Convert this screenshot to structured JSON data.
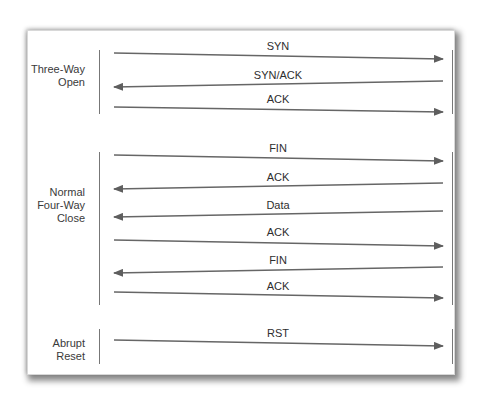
{
  "diagram": {
    "title": "",
    "colors": {
      "line": "#6b6b6b",
      "arrow": "#5e5e5e",
      "text": "#333333",
      "background": "#ffffff"
    },
    "groups": [
      {
        "label_lines": [
          "Three-Way",
          "Open"
        ],
        "messages": [
          {
            "label": "SYN",
            "direction": "right"
          },
          {
            "label": "SYN/ACK",
            "direction": "left"
          },
          {
            "label": "ACK",
            "direction": "right"
          }
        ]
      },
      {
        "label_lines": [
          "Normal",
          "Four-Way",
          "Close"
        ],
        "messages": [
          {
            "label": "FIN",
            "direction": "right"
          },
          {
            "label": "ACK",
            "direction": "left"
          },
          {
            "label": "Data",
            "direction": "left"
          },
          {
            "label": "ACK",
            "direction": "right"
          },
          {
            "label": "FIN",
            "direction": "left"
          },
          {
            "label": "ACK",
            "direction": "right"
          }
        ]
      },
      {
        "label_lines": [
          "Abrupt",
          "Reset"
        ],
        "messages": [
          {
            "label": "RST",
            "direction": "right"
          }
        ]
      }
    ]
  }
}
